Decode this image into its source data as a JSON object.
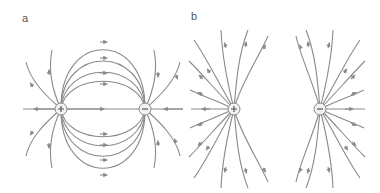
{
  "figure": {
    "panels": [
      {
        "label": "a",
        "description": "Electric field lines of a dipole: positive charge on left, negative charge on right; lines run from + to −",
        "charges": [
          {
            "sign": "+",
            "x": 61,
            "y": 109
          },
          {
            "sign": "−",
            "x": 145,
            "y": 109
          }
        ]
      },
      {
        "label": "b",
        "description": "Electric field lines of two separated charges, + on left and − on right, each with radial field lines",
        "charges": [
          {
            "sign": "+",
            "x": 234,
            "y": 109
          },
          {
            "sign": "−",
            "x": 320,
            "y": 109
          }
        ]
      }
    ],
    "colors": {
      "line": "#8a8a8a",
      "charge_fill": "#f2f2f2",
      "label": "#555555"
    }
  }
}
